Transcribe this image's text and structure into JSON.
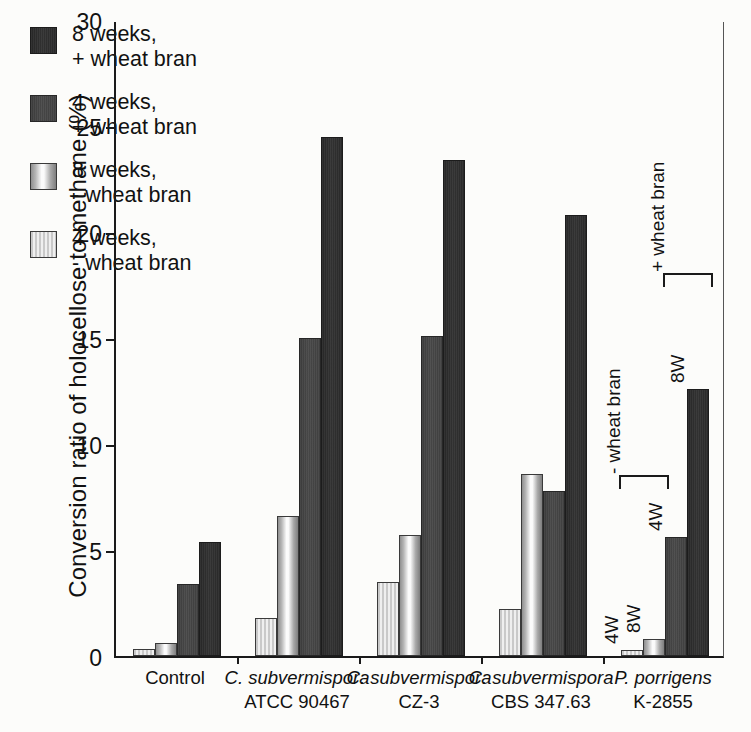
{
  "chart_data": {
    "type": "bar",
    "title": "",
    "xlabel": "",
    "ylabel": "Conversion ratio of holocellose to methane  (%)",
    "ylim": [
      0,
      30
    ],
    "yticks": [
      0,
      5,
      10,
      15,
      20,
      25,
      30
    ],
    "grid": false,
    "legend_position": "upper-left-inside",
    "categories": [
      "Control",
      "C. subvermispora ATCC 90467",
      "C. subvermispora CZ-3",
      "C. subvermispora CBS 347.63",
      "P. porrigens K-2855"
    ],
    "category_lines": [
      [
        "Control",
        ""
      ],
      [
        "C. subvermispora",
        "ATCC 90467"
      ],
      [
        "C. subvermispora",
        "CZ-3"
      ],
      [
        "C. subvermispora",
        "CBS 347.63"
      ],
      [
        "P. porrigens",
        "K-2855"
      ]
    ],
    "series": [
      {
        "name": "4 weeks, - wheat bran",
        "values": [
          0.35,
          1.8,
          3.5,
          2.2,
          0.3
        ]
      },
      {
        "name": "8 weeks, - wheat bran",
        "values": [
          0.6,
          6.6,
          5.7,
          8.6,
          0.8
        ]
      },
      {
        "name": "4 weeks, + wheat bran",
        "values": [
          3.4,
          15.0,
          15.1,
          7.8,
          5.6
        ]
      },
      {
        "name": "8 weeks, + wheat bran",
        "values": [
          5.4,
          24.5,
          23.4,
          20.8,
          12.6
        ]
      }
    ],
    "annotations": [
      {
        "text": "- wheat bran"
      },
      {
        "text": "+ wheat bran"
      },
      {
        "text": "4W"
      },
      {
        "text": "8W"
      },
      {
        "text": "4W"
      },
      {
        "text": "8W"
      }
    ]
  },
  "legend": {
    "items": [
      {
        "line1": "8 weeks,",
        "line2": "+ wheat bran",
        "swatch": "dark-grainy"
      },
      {
        "line1": "4 weeks,",
        "line2": "+ wheat bran",
        "swatch": "mid-dark-grainy"
      },
      {
        "line1": "8 weeks,",
        "line2": "- wheat bran",
        "swatch": "light-gradient"
      },
      {
        "line1": "4 weeks,",
        "line2": "- wheat bran",
        "swatch": "light-hatched"
      }
    ]
  },
  "axis": {
    "y_title": "Conversion ratio of holocellose to methane  (%)",
    "y_tick_labels": [
      "30",
      "25",
      "20",
      "15",
      "10",
      "5",
      "0"
    ]
  },
  "colors": {
    "axis": "#1a1a1a",
    "series_4w_minus": "#dcdcdc",
    "series_8w_minus": "#f0f0f0",
    "series_4w_plus": "#444444",
    "series_8w_plus": "#2c2c2c",
    "background": "#fcfcfa"
  }
}
